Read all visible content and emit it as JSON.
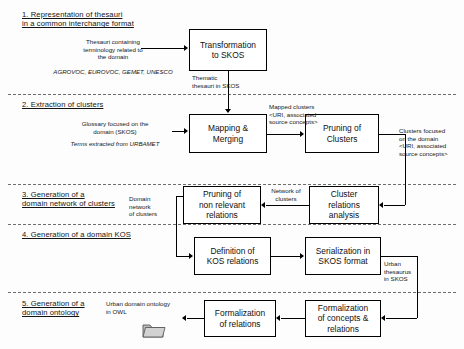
{
  "diagram": {
    "sections": [
      {
        "id": "s1",
        "heading": "1. Representation of thesauri\nin a common interchange format"
      },
      {
        "id": "s2",
        "heading": "2. Extraction of clusters"
      },
      {
        "id": "s3",
        "heading": "3. Generation of a\ndomain network of clusters"
      },
      {
        "id": "s4",
        "heading": "4. Generation of a domain KOS"
      },
      {
        "id": "s5",
        "heading": "5. Generation of a\ndomain ontology"
      }
    ],
    "boxes": [
      {
        "id": "b1",
        "label": "Transformation\nto SKOS"
      },
      {
        "id": "b2",
        "label": "Mapping &\nMerging"
      },
      {
        "id": "b3",
        "label": "Pruning of\nClusters"
      },
      {
        "id": "b4",
        "label": "Pruning of\nnon relevant\nrelations"
      },
      {
        "id": "b5",
        "label": "Cluster\nrelations\nanalysis"
      },
      {
        "id": "b6",
        "label": "Definition of\nKOS relations"
      },
      {
        "id": "b7",
        "label": "Serialization in\nSKOS format"
      },
      {
        "id": "b8",
        "label": "Formalization\nof relations"
      },
      {
        "id": "b9",
        "label": "Formalization\nof concepts &\nrelations"
      }
    ],
    "labels": {
      "input_thesauri": "Thesauri containing\nterminology related to\nthe domain",
      "input_thesauri_examples": "AGROVOC, EUROVOC, GEMET, UNESCO",
      "thematic_thesauri": "Thematic\nthesauri in SKOS",
      "glossary": "Glossary focused on the\ndomain (SKOS)",
      "glossary_source": "Terms extracted from URBAMET",
      "mapped_clusters": "Mapped clusters\n<URI, associated\nsource concepts>",
      "clusters_focused": "Clusters focused\non the domain\n<URI, associated\nsource concepts>",
      "domain_network": "Domain\nnetwork\nof clusters",
      "network_of_clusters": "Network of\nclusters",
      "urban_thesaurus": "Urban\nthesaurus\nin SKOS",
      "urban_ontology": "Urban domain ontology\nin OWL"
    },
    "icons": {
      "output_document": "folder-icon"
    },
    "colors": {
      "stroke": "#000000",
      "divider": "#6d6d6d",
      "background": "#fdfdfd"
    }
  }
}
